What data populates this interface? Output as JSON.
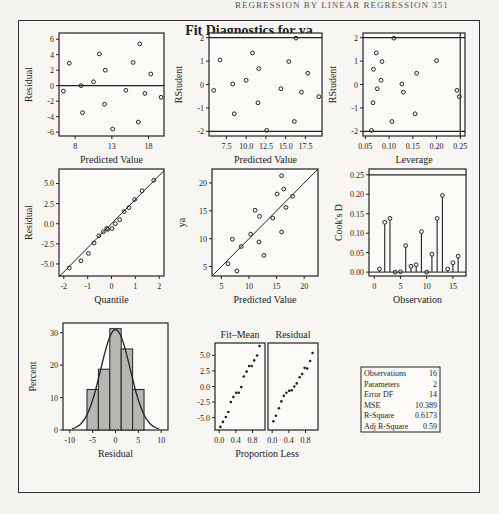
{
  "page_header": "REGRESSION BY LINEAR REGRESSION    351",
  "title": "Fit Diagnostics for ya",
  "chart_data": [
    {
      "id": "resid-vs-pred",
      "type": "scatter",
      "xlabel": "Predicted Value",
      "ylabel": "Residual",
      "xlim": [
        5.3,
        19.6
      ],
      "ylim": [
        -6.5,
        6.8
      ],
      "xticks": [
        7.5,
        12.5,
        17.5
      ],
      "yticks": [
        -6,
        -4,
        -2,
        0,
        2,
        4,
        6
      ],
      "ref_h": [
        0
      ],
      "points": [
        [
          5.9,
          -0.7
        ],
        [
          6.7,
          2.9
        ],
        [
          8.5,
          -3.5
        ],
        [
          8.3,
          0.0
        ],
        [
          10.0,
          0.5
        ],
        [
          10.8,
          4.1
        ],
        [
          11.6,
          2.0
        ],
        [
          11.5,
          -2.4
        ],
        [
          12.6,
          -5.6
        ],
        [
          14.4,
          -0.6
        ],
        [
          15.4,
          3.0
        ],
        [
          16.3,
          5.4
        ],
        [
          16.1,
          -4.7
        ],
        [
          17.0,
          -1.0
        ],
        [
          17.8,
          1.5
        ],
        [
          19.2,
          -1.5
        ]
      ]
    },
    {
      "id": "rstudent-vs-pred",
      "type": "scatter",
      "xlabel": "Predicted Value",
      "ylabel": "RStudent",
      "xlim": [
        5.3,
        19.6
      ],
      "ylim": [
        -2.2,
        2.2
      ],
      "xticks": [
        7.5,
        10.0,
        12.5,
        15.0,
        17.5
      ],
      "yticks": [
        -2,
        -1,
        0,
        1,
        2
      ],
      "ref_h": [
        -2,
        2
      ],
      "points": [
        [
          5.9,
          -0.25
        ],
        [
          6.7,
          1.05
        ],
        [
          8.5,
          -1.25
        ],
        [
          8.3,
          0.02
        ],
        [
          10.0,
          0.18
        ],
        [
          10.8,
          1.35
        ],
        [
          11.6,
          0.68
        ],
        [
          11.5,
          -0.78
        ],
        [
          12.6,
          -1.96
        ],
        [
          14.4,
          -0.18
        ],
        [
          15.4,
          0.98
        ],
        [
          16.3,
          1.98
        ],
        [
          16.1,
          -1.58
        ],
        [
          17.0,
          -0.33
        ],
        [
          17.8,
          0.48
        ],
        [
          19.2,
          -0.52
        ]
      ]
    },
    {
      "id": "rstudent-vs-leverage",
      "type": "scatter",
      "xlabel": "Leverage",
      "ylabel": "RStudent",
      "xlim": [
        0.045,
        0.26
      ],
      "ylim": [
        -2.2,
        2.2
      ],
      "xticks": [
        0.05,
        0.1,
        0.15,
        0.2,
        0.25
      ],
      "yticks": [
        -2,
        -1,
        0,
        1,
        2
      ],
      "ref_h": [
        -2,
        2
      ],
      "ref_v": [
        0.25
      ],
      "points": [
        [
          0.063,
          -1.96
        ],
        [
          0.067,
          0.65
        ],
        [
          0.066,
          -0.78
        ],
        [
          0.073,
          1.35
        ],
        [
          0.075,
          -0.18
        ],
        [
          0.083,
          0.18
        ],
        [
          0.085,
          0.98
        ],
        [
          0.11,
          1.98
        ],
        [
          0.106,
          -1.58
        ],
        [
          0.127,
          0.02
        ],
        [
          0.13,
          -0.33
        ],
        [
          0.155,
          -1.25
        ],
        [
          0.158,
          0.48
        ],
        [
          0.2,
          1.02
        ],
        [
          0.243,
          -0.25
        ],
        [
          0.248,
          -0.52
        ]
      ]
    },
    {
      "id": "resid-qq",
      "type": "scatter",
      "xlabel": "Quantile",
      "ylabel": "Residual",
      "xlim": [
        -2.2,
        2.2
      ],
      "ylim": [
        -6.5,
        6.8
      ],
      "xticks": [
        -2,
        -1,
        0,
        1,
        2
      ],
      "yticks": [
        -5.0,
        -2.5,
        0.0,
        2.5,
        5.0
      ],
      "diag_line": [
        [
          -2.2,
          -6.6
        ],
        [
          2.2,
          6.6
        ]
      ],
      "points": [
        [
          -1.77,
          -5.5
        ],
        [
          -1.28,
          -4.6
        ],
        [
          -0.97,
          -3.7
        ],
        [
          -0.73,
          -2.4
        ],
        [
          -0.53,
          -1.5
        ],
        [
          -0.34,
          -1.0
        ],
        [
          -0.16,
          -0.7
        ],
        [
          -0.2,
          -0.6
        ],
        [
          0.02,
          -0.6
        ],
        [
          0.16,
          0.0
        ],
        [
          0.34,
          0.5
        ],
        [
          0.53,
          1.5
        ],
        [
          0.73,
          2.0
        ],
        [
          0.97,
          3.0
        ],
        [
          1.28,
          4.1
        ],
        [
          1.77,
          5.4
        ]
      ]
    },
    {
      "id": "ya-vs-pred",
      "type": "scatter",
      "xlabel": "Predicted Value",
      "ylabel": "ya",
      "xlim": [
        3.3,
        22.5
      ],
      "ylim": [
        3.3,
        22.5
      ],
      "xticks": [
        5,
        10,
        15,
        20
      ],
      "yticks": [
        5,
        10,
        15,
        20
      ],
      "diag_line": [
        [
          3.3,
          3.3
        ],
        [
          22.5,
          22.5
        ]
      ],
      "points": [
        [
          6.2,
          5.5
        ],
        [
          7.0,
          9.9
        ],
        [
          7.8,
          4.2
        ],
        [
          8.6,
          8.6
        ],
        [
          10.3,
          10.8
        ],
        [
          11.1,
          15.1
        ],
        [
          11.8,
          9.4
        ],
        [
          11.9,
          14.0
        ],
        [
          12.7,
          7.0
        ],
        [
          14.3,
          13.7
        ],
        [
          15.1,
          18.0
        ],
        [
          15.9,
          21.3
        ],
        [
          15.9,
          11.2
        ],
        [
          16.7,
          15.6
        ],
        [
          16.3,
          18.9
        ],
        [
          17.9,
          17.6
        ]
      ]
    },
    {
      "id": "cooks-d",
      "type": "needle",
      "xlabel": "Observation",
      "ylabel": "Cook's D",
      "xlim": [
        -1,
        17.5
      ],
      "ylim": [
        -0.01,
        0.265
      ],
      "xticks": [
        0,
        5,
        10,
        15
      ],
      "yticks": [
        0.0,
        0.05,
        0.1,
        0.15,
        0.2,
        0.25
      ],
      "ref_h": [
        0.25
      ],
      "x": [
        1,
        2,
        3,
        4,
        5,
        6,
        7,
        8,
        9,
        10,
        11,
        12,
        13,
        14,
        15,
        16
      ],
      "values": [
        0.008,
        0.128,
        0.138,
        0.0,
        0.001,
        0.068,
        0.015,
        0.019,
        0.104,
        0.0,
        0.046,
        0.138,
        0.197,
        0.008,
        0.024,
        0.041
      ]
    },
    {
      "id": "resid-histogram",
      "type": "bar",
      "xlabel": "Residual",
      "ylabel": "Percent",
      "xlim": [
        -11.5,
        11.5
      ],
      "ylim": [
        0,
        33
      ],
      "xticks": [
        -10,
        -5,
        0,
        5,
        10
      ],
      "yticks": [
        0,
        10,
        20,
        30
      ],
      "bin_edges": [
        -6.25,
        -3.75,
        -1.25,
        1.25,
        3.75,
        6.25
      ],
      "values": [
        12.5,
        18.75,
        31.25,
        25.0,
        12.5
      ],
      "normal_curve": {
        "mean": 0,
        "sd": 3.22
      }
    },
    {
      "id": "rf-spread",
      "type": "scatter",
      "xlabel": "Proportion Less",
      "panels": [
        {
          "label": "Fit–Mean",
          "points": [
            [
              0.03,
              -6.5
            ],
            [
              0.09,
              -5.7
            ],
            [
              0.16,
              -4.9
            ],
            [
              0.22,
              -4.1
            ],
            [
              0.28,
              -2.5
            ],
            [
              0.34,
              -1.7
            ],
            [
              0.41,
              -1.0
            ],
            [
              0.47,
              -1.0
            ],
            [
              0.53,
              -0.1
            ],
            [
              0.59,
              1.6
            ],
            [
              0.66,
              2.4
            ],
            [
              0.72,
              3.3
            ],
            [
              0.78,
              3.3
            ],
            [
              0.84,
              4.2
            ],
            [
              0.91,
              5.0
            ],
            [
              0.97,
              6.5
            ]
          ]
        },
        {
          "label": "Residual",
          "points": [
            [
              0.03,
              -5.6
            ],
            [
              0.09,
              -4.7
            ],
            [
              0.16,
              -3.5
            ],
            [
              0.22,
              -2.4
            ],
            [
              0.28,
              -1.5
            ],
            [
              0.34,
              -1.0
            ],
            [
              0.41,
              -0.7
            ],
            [
              0.47,
              -0.6
            ],
            [
              0.53,
              0.0
            ],
            [
              0.59,
              0.5
            ],
            [
              0.66,
              1.5
            ],
            [
              0.72,
              2.0
            ],
            [
              0.78,
              3.0
            ],
            [
              0.84,
              2.9
            ],
            [
              0.91,
              4.1
            ],
            [
              0.97,
              5.4
            ]
          ]
        }
      ],
      "xlim": [
        -0.1,
        1.1
      ],
      "ylim": [
        -7.0,
        7.0
      ],
      "xticks": [
        0.0,
        0.4,
        0.8
      ],
      "yticks": [
        -5.0,
        -2.5,
        0.0,
        2.5,
        5.0
      ]
    },
    {
      "id": "fit-statistics",
      "type": "table",
      "rows": [
        {
          "label": "Observations",
          "value": "16"
        },
        {
          "label": "Parameters",
          "value": "2"
        },
        {
          "label": "Error DF",
          "value": "14"
        },
        {
          "label": "MSE",
          "value": "10.389"
        },
        {
          "label": "R-Square",
          "value": "0.6173"
        },
        {
          "label": "Adj R-Square",
          "value": "0.59"
        }
      ]
    }
  ]
}
